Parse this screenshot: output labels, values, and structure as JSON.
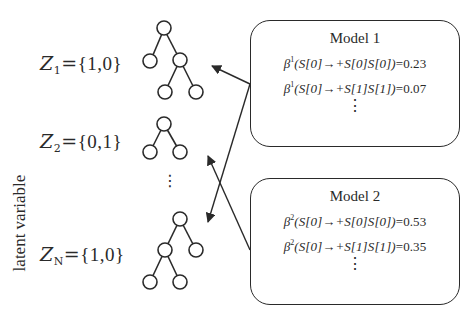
{
  "axis": {
    "label": "latent variable"
  },
  "latent_variables": [
    {
      "name": "Z",
      "subscript": "1",
      "value": "{1,0}",
      "tree": "root with left leaf and right subtree (two leaves)"
    },
    {
      "name": "Z",
      "subscript": "2",
      "value": "{0,1}",
      "tree": "root with two leaves"
    },
    {
      "ellipsis": "⋮"
    },
    {
      "name": "Z",
      "subscript": "N",
      "value": "{1,0}",
      "tree": "root with left subtree (two leaves) and right leaf"
    }
  ],
  "models": [
    {
      "title": "Model 1",
      "rules": [
        {
          "symbol": "β",
          "sup": "1",
          "rule": "(S[0]→+S[0]S[0])",
          "value": "=0.23"
        },
        {
          "symbol": "β",
          "sup": "1",
          "rule": "(S[0]→+S[1]S[1])",
          "value": "=0.07"
        }
      ],
      "ellipsis": "⋮"
    },
    {
      "title": "Model 2",
      "rules": [
        {
          "symbol": "β",
          "sup": "2",
          "rule": "(S[0]→+S[0]S[0])",
          "value": "=0.53"
        },
        {
          "symbol": "β",
          "sup": "2",
          "rule": "(S[0]→+S[1]S[1])",
          "value": "=0.35"
        }
      ],
      "ellipsis": "⋮"
    }
  ],
  "arrows": [
    {
      "from": "Model 1",
      "to": "Z_1 tree"
    },
    {
      "from": "Model 1",
      "to": "Z_N tree"
    },
    {
      "from": "Model 2",
      "to": "Z_2 tree"
    }
  ],
  "colors": {
    "ink": "#2a2a2a",
    "background": "#ffffff"
  }
}
